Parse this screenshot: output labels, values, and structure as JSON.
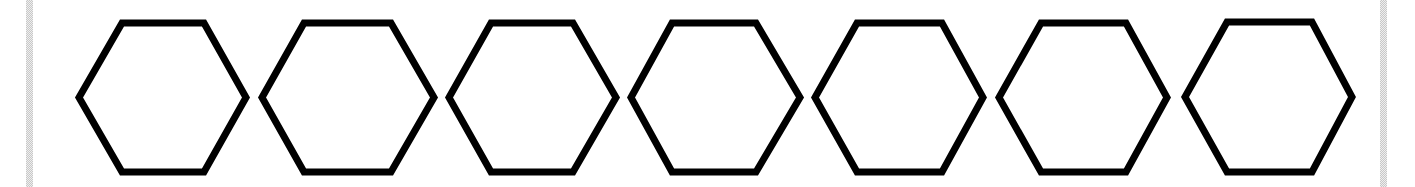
{
  "diagram": {
    "shape": "hexagon",
    "count": 7,
    "stroke_color": "#000000",
    "fill_color": "#ffffff",
    "stroke_width": 7,
    "hexagons": [
      {
        "left": 79,
        "top_left": 122,
        "top_right": 204,
        "right": 246,
        "top": 23,
        "bottom": 172
      },
      {
        "left": 262,
        "top_left": 304,
        "top_right": 391,
        "right": 434,
        "top": 23,
        "bottom": 172
      },
      {
        "left": 449,
        "top_left": 491,
        "top_right": 573,
        "right": 616,
        "top": 23,
        "bottom": 172
      },
      {
        "left": 631,
        "top_left": 672,
        "top_right": 756,
        "right": 800,
        "top": 23,
        "bottom": 172
      },
      {
        "left": 815,
        "top_left": 857,
        "top_right": 942,
        "right": 983,
        "top": 23,
        "bottom": 172
      },
      {
        "left": 999,
        "top_left": 1041,
        "top_right": 1126,
        "right": 1167,
        "top": 23,
        "bottom": 172
      },
      {
        "left": 1185,
        "top_left": 1227,
        "top_right": 1312,
        "right": 1352,
        "top": 22,
        "bottom": 172
      }
    ]
  },
  "frame": {
    "edge_bar_color": "#c8c8c8"
  }
}
